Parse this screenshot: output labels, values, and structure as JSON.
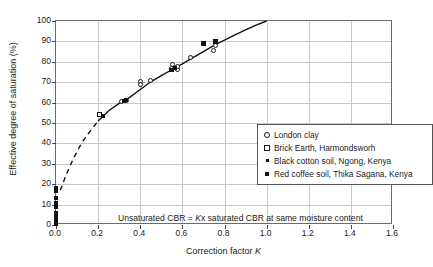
{
  "chart_data": {
    "type": "scatter",
    "title": "",
    "xlabel": "Correction factor K",
    "ylabel": "Effective degree of saturation (%)",
    "xlim": [
      0.0,
      1.6
    ],
    "ylim": [
      0,
      100
    ],
    "xticks": [
      "0.0",
      "0.2",
      "0.4",
      "0.6",
      "0.8",
      "1.0",
      "1.2",
      "1.4",
      "1.6"
    ],
    "yticks": [
      "0",
      "10",
      "20",
      "30",
      "40",
      "50",
      "60",
      "70",
      "80",
      "90",
      "100"
    ],
    "grid": true,
    "legend_position": "center-right",
    "annotation": "Unsaturated CBR = Kx saturated CBR at same moisture content",
    "series": [
      {
        "name": "London clay",
        "marker": "open-circle",
        "points": [
          [
            0.4,
            70.5
          ],
          [
            0.4,
            68.8
          ],
          [
            0.45,
            71.0
          ],
          [
            0.55,
            76.5
          ],
          [
            0.555,
            78.5
          ],
          [
            0.57,
            77.0
          ],
          [
            0.575,
            76.2
          ],
          [
            0.575,
            77.8
          ],
          [
            0.64,
            82.0
          ],
          [
            0.75,
            85.3
          ],
          [
            0.755,
            88.0
          ],
          [
            0.335,
            61.0
          ],
          [
            0.31,
            60.5
          ]
        ]
      },
      {
        "name": "Brick Earth, Harmondsworh",
        "marker": "open-square",
        "points": [
          [
            0.205,
            54.2
          ]
        ]
      },
      {
        "name": "Black cotton soil, Ngong, Kenya",
        "marker": "filled-small",
        "points": [
          [
            0.0,
            0.5
          ],
          [
            0.0,
            2.0
          ],
          [
            0.0,
            4.0
          ],
          [
            0.0,
            6.0
          ],
          [
            0.0,
            9.0
          ],
          [
            0.0,
            10.0
          ],
          [
            0.0,
            11.0
          ],
          [
            0.0,
            13.0
          ],
          [
            0.0,
            16.5
          ],
          [
            0.0,
            18.0
          ],
          [
            0.225,
            53.2
          ],
          [
            0.325,
            61.0
          ],
          [
            0.33,
            61.2
          ],
          [
            0.545,
            75.8
          ],
          [
            0.55,
            76.0
          ],
          [
            0.565,
            76.8
          ],
          [
            0.755,
            90.0
          ]
        ]
      },
      {
        "name": "Red coffee soil, Thika Sagana, Kenya",
        "marker": "filled-big",
        "points": [
          [
            0.7,
            89.0
          ],
          [
            0.755,
            89.8
          ]
        ]
      }
    ],
    "fit_curve": {
      "solid_segment": [
        [
          0.2,
          51.0
        ],
        [
          0.25,
          56.0
        ],
        [
          0.3,
          59.6
        ],
        [
          0.35,
          62.6
        ],
        [
          0.4,
          66.4
        ],
        [
          0.45,
          70.2
        ],
        [
          0.5,
          73.2
        ],
        [
          0.55,
          76.1
        ],
        [
          0.6,
          79.0
        ],
        [
          0.65,
          82.0
        ],
        [
          0.7,
          85.0
        ],
        [
          0.75,
          88.0
        ],
        [
          0.8,
          90.6
        ],
        [
          0.85,
          93.2
        ],
        [
          0.9,
          95.6
        ],
        [
          0.95,
          98.0
        ],
        [
          1.0,
          100.0
        ]
      ],
      "dashed_segment": [
        [
          0.02,
          17.0
        ],
        [
          0.05,
          25.0
        ],
        [
          0.08,
          32.0
        ],
        [
          0.11,
          38.0
        ],
        [
          0.14,
          43.0
        ],
        [
          0.17,
          47.0
        ],
        [
          0.2,
          51.0
        ]
      ]
    }
  },
  "legend": {
    "entries": [
      {
        "label": "London clay",
        "marker": "open-circle"
      },
      {
        "label": "Brick Earth, Harmondsworh",
        "marker": "open-square"
      },
      {
        "label": "Black cotton soil, Ngong, Kenya",
        "marker": "filled-small"
      },
      {
        "label": "Red coffee soil, Thika Sagana, Kenya",
        "marker": "filled-big"
      }
    ]
  },
  "annotation": {
    "prefix": "Unsaturated CBR = ",
    "italic": "K",
    "suffix": "x saturated CBR at same moisture content"
  },
  "axis_titles": {
    "x_prefix": "Correction factor ",
    "x_italic": "K",
    "y": "Effective degree of saturation (%)"
  },
  "colors": {
    "frame": "#6b6b6b",
    "grid": "#c9c9c9",
    "curve": "#111111",
    "text": "#1a1a1a",
    "background": "#ffffff"
  }
}
